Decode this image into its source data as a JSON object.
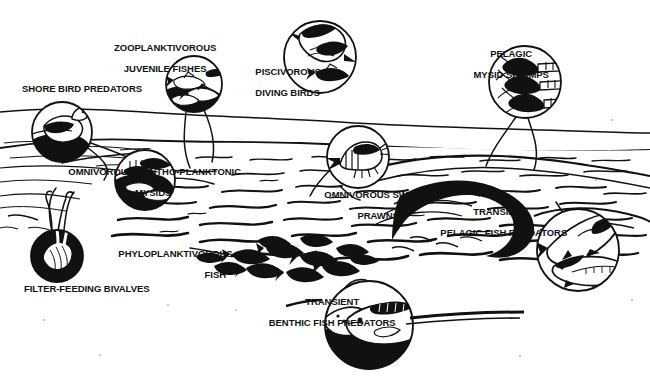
{
  "figure": {
    "medium": "black-and-white pen-and-ink drawing",
    "background_color": "#ffffff",
    "ink_color": "#111111",
    "width": 650,
    "height": 382
  },
  "labels": [
    {
      "id": "shore-bird-predators",
      "text": "SHORE BIRD PREDATORS",
      "lines": [
        "SHORE BIRD PREDATORS"
      ],
      "align": "left",
      "x": 22,
      "y": 84,
      "organism": "shore bird wading at waterline"
    },
    {
      "id": "zooplanktivorous-juvenile-fishes",
      "text": "ZOOPLANKTIVOROUS JUVENILE FISHES",
      "lines": [
        "ZOOPLANKTIVOROUS",
        "JUVENILE FISHES"
      ],
      "align": "center",
      "x": 100,
      "y": 32,
      "organism": "school of small juvenile fishes"
    },
    {
      "id": "piscivorous-diving-birds",
      "text": "PISCIVOROUS DIVING BIRDS",
      "lines": [
        "PISCIVOROUS",
        "DIVING BIRDS"
      ],
      "align": "left",
      "x": 245,
      "y": 56,
      "organism": "tern diving with fish"
    },
    {
      "id": "pelagic-mysid-shrimps",
      "text": "PELAGIC MYSID SHRIMPS",
      "lines": [
        "PELAGIC",
        "MYSID SHRIMPS"
      ],
      "align": "center",
      "x": 460,
      "y": 38,
      "organism": "cluster of mysid shrimps"
    },
    {
      "id": "omnivorous-bentho-planktonic-mysids",
      "text": "OMNIVOROUS BENTHO-PLANKTONIC MYSIDS",
      "lines": [
        "OMNIVOROUS BENTHO-PLANKTONIC",
        "MYSIDS"
      ],
      "align": "center",
      "x": 60,
      "y": 156,
      "organism": "benthic mysid swarm"
    },
    {
      "id": "omnivorous-swimming-prawns",
      "text": "OMNIVOROUS SWIMMING PRAWNS",
      "lines": [
        "OMNIVOROUS SWIMMING",
        "PRAWNS"
      ],
      "align": "center",
      "x": 315,
      "y": 179,
      "organism": "swimming prawn"
    },
    {
      "id": "transient-pelagic-fish-predators",
      "text": "TRANSIENT PELAGIC FISH PREDATORS",
      "lines": [
        "TRANSIENT",
        "PELAGIC FISH PREDATORS"
      ],
      "align": "center",
      "x": 432,
      "y": 196,
      "organism": "pair of pelagic predatory fish"
    },
    {
      "id": "phyloplanktivorous-fish",
      "text": "PHYLOPLANKTIVOROUS FISH",
      "lines": [
        "PHYLOPLANKTIVOROUS",
        "FISH"
      ],
      "align": "right",
      "x": 112,
      "y": 238,
      "organism": "dense school of planktivorous fish"
    },
    {
      "id": "filter-feeding-bivalves",
      "text": "FILTER-FEEDING BIVALVES",
      "lines": [
        "FILTER-FEEDING BIVALVES"
      ],
      "align": "left",
      "x": 24,
      "y": 284,
      "organism": "bivalve mollusc with siphons"
    },
    {
      "id": "transient-benthic-fish-predators",
      "text": "TRANSIENT BENTHIC FISH PREDATORS",
      "lines": [
        "TRANSIENT",
        "BENTHIC FISH PREDATORS"
      ],
      "align": "center",
      "x": 260,
      "y": 286,
      "organism": "benthic predatory fish and flatfish"
    }
  ],
  "callouts": [
    {
      "id": "shore-bird-predators-circle",
      "cx": 62,
      "cy": 132,
      "r": 30
    },
    {
      "id": "zooplanktivorous-juvenile-fishes-circle",
      "cx": 194,
      "cy": 84,
      "r": 28
    },
    {
      "id": "piscivorous-diving-birds-circle",
      "cx": 320,
      "cy": 57,
      "r": 36
    },
    {
      "id": "pelagic-mysid-shrimps-circle",
      "cx": 525,
      "cy": 82,
      "r": 36
    },
    {
      "id": "omnivorous-bentho-planktonic-mysids-circle",
      "cx": 145,
      "cy": 180,
      "r": 30
    },
    {
      "id": "omnivorous-swimming-prawns-circle",
      "cx": 358,
      "cy": 157,
      "r": 31
    },
    {
      "id": "transient-pelagic-fish-predators-circle",
      "cx": 578,
      "cy": 250,
      "r": 41
    },
    {
      "id": "filter-feeding-bivalves-circle",
      "cx": 57,
      "cy": 256,
      "r": 26
    },
    {
      "id": "transient-benthic-fish-predators-circle",
      "cx": 369,
      "cy": 325,
      "r": 44
    }
  ]
}
